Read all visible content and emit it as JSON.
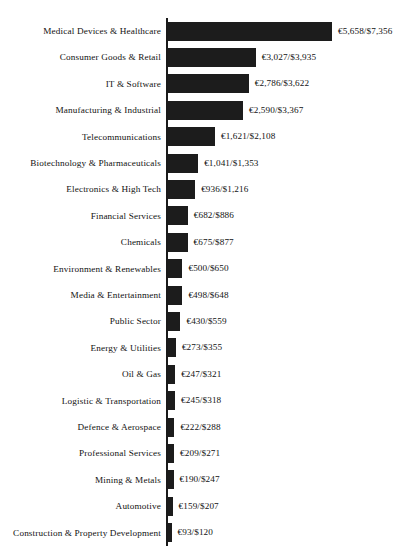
{
  "chart_data": {
    "type": "bar",
    "orientation": "horizontal",
    "title": "",
    "subtitle": "",
    "xlabel": "",
    "ylabel": "",
    "grid": false,
    "legend": null,
    "axis_line": true,
    "xlim": [
      0,
      5658
    ],
    "categories": [
      "Medical Devices & Healthcare",
      "Consumer Goods & Retail",
      "IT & Software",
      "Manufacturing & Industrial",
      "Telecommunications",
      "Biotechnology & Pharmaceuticals",
      "Electronics & High Tech",
      "Financial Services",
      "Chemicals",
      "Environment & Renewables",
      "Media & Entertainment",
      "Public Sector",
      "Energy & Utilities",
      "Oil & Gas",
      "Logistic & Transportation",
      "Defence & Aerospace",
      "Professional Services",
      "Mining & Metals",
      "Automotive",
      "Construction & Property Development"
    ],
    "values": [
      5658,
      3027,
      2786,
      2590,
      1621,
      1041,
      936,
      682,
      675,
      500,
      498,
      430,
      273,
      247,
      245,
      222,
      209,
      190,
      159,
      93
    ],
    "values_usd": [
      7356,
      3935,
      3622,
      3367,
      2108,
      1353,
      1216,
      886,
      877,
      650,
      648,
      559,
      355,
      321,
      318,
      288,
      271,
      247,
      207,
      120
    ],
    "data_labels": [
      "€5,658/$7,356",
      "€3,027/$3,935",
      "€2,786/$3,622",
      "€2,590/$3,367",
      "€1,621/$2,108",
      "€1,041/$1,353",
      "€936/$1,216",
      "€682/$886",
      "€675/$877",
      "€500/$650",
      "€498/$648",
      "€430/$559",
      "€273/$355",
      "€247/$321",
      "€245/$318",
      "€222/$288",
      "€209/$271",
      "€190/$247",
      "€159/$207",
      "€93/$120"
    ],
    "bar_color": "#1c1c1c",
    "text_color": "#121212",
    "background_color": "#ffffff"
  }
}
